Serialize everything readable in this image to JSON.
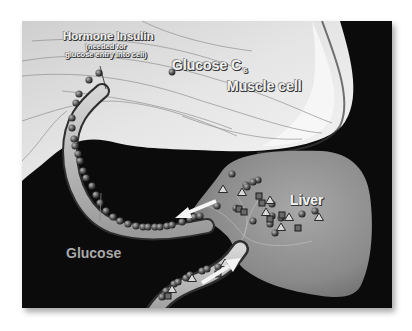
{
  "figure": {
    "labels": {
      "insulin": "Hormone Insulin",
      "insulin_note_line1": "(needed for",
      "insulin_note_line2": "glucose entry into cell)",
      "glucose_c6": "Glucose C",
      "glucose_c6_subscript": "6",
      "muscle_cell": "Muscle cell",
      "liver": "Liver",
      "glucose": "Glucose"
    },
    "colors": {
      "background": "#0b0b0b",
      "muscle": "#d9d9d9",
      "liver": "#8f8f8f",
      "vessel": "#bdbdbd",
      "molecule": "#5a5a5a",
      "arrow": "#f5f5f5"
    },
    "legend_molecules": [
      "glucose-sphere",
      "insulin-triangle",
      "glycogen-square"
    ]
  }
}
